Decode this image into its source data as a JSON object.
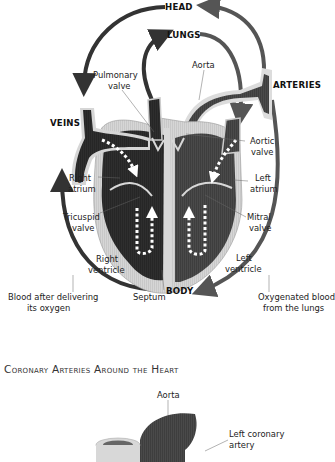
{
  "diagram1": {
    "labels": {
      "head": "HEAD",
      "lungs": "LUNGS",
      "arteries": "ARTERIES",
      "veins": "VEINS",
      "body": "BODY",
      "aorta": "Aorta",
      "pulmonary_valve_1": "Pulmonary",
      "pulmonary_valve_2": "valve",
      "aortic_valve_1": "Aortic",
      "aortic_valve_2": "valve",
      "right_atrium_1": "Right",
      "right_atrium_2": "atrium",
      "left_atrium_1": "Left",
      "left_atrium_2": "atrium",
      "tricuspid_valve_1": "Tricuspid",
      "tricuspid_valve_2": "valve",
      "mitral_valve_1": "Mitral",
      "mitral_valve_2": "valve",
      "right_ventricle_1": "Right",
      "right_ventricle_2": "ventricle",
      "left_ventricle_1": "Left",
      "left_ventricle_2": "ventricle",
      "septum": "Septum",
      "deoxygenated_1": "Blood after delivering",
      "deoxygenated_2": "its oxygen",
      "oxygenated_1": "Oxygenated blood",
      "oxygenated_2": "from the lungs"
    },
    "colors": {
      "right_heart": "#2b2b2b",
      "left_heart": "#4a4a4a",
      "wall": "#cfcfcf",
      "arrow": "#3a3a3a"
    }
  },
  "diagram2": {
    "title": "Coronary Arteries Around the Heart",
    "labels": {
      "aorta": "Aorta",
      "left_coronary_1": "Left coronary",
      "left_coronary_2": "artery"
    }
  }
}
